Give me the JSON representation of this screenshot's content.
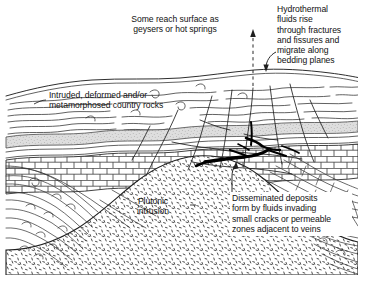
{
  "figure": {
    "type": "geological-cross-section",
    "width": 366,
    "height": 289,
    "background_color": "#ffffff",
    "ink_color": "#1a1a1a"
  },
  "labels": {
    "geysers": "Some reach surface as\ngeysers or hot springs",
    "hydrothermal": "Hydrothermal\nfluids rise\nthrough fractures\nand fissures and\nmigrate along\nbedding planes",
    "country_rocks": "Intruded, deformed and/or\nmetamorphosed country rocks",
    "plutonic": "Plutonic\nintrusion",
    "disseminated": "Disseminated deposits\nform by fluids invading\nsmall cracks or permeable\nzones adjacent to veins"
  },
  "annotations": {
    "geyser_arrow": "upward-dashed-arrow",
    "hydrothermal_leader": "curved-leader-arrow",
    "disseminated_leader": "vertical-leader-arrow"
  },
  "units": [
    {
      "name": "wavy-metamorphic-strata",
      "pattern": "wavy-lines",
      "fill": "#ffffff",
      "position": "upper"
    },
    {
      "name": "shaded-bedding-band",
      "pattern": "stipple-gray",
      "fill": "#d9d9d9",
      "position": "upper-contact"
    },
    {
      "name": "brick-limestone-layer",
      "pattern": "brick",
      "fill": "#ffffff",
      "position": "middle"
    },
    {
      "name": "plutonic-intrusion",
      "pattern": "stipple-dash",
      "fill": "#ffffff",
      "position": "core-dome"
    },
    {
      "name": "vein-deposits",
      "pattern": "thick-black-lines",
      "fill": "#000000",
      "position": "contact-zone"
    }
  ]
}
